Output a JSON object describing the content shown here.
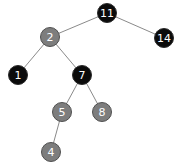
{
  "diagram": {
    "type": "red-black-tree",
    "colors": {
      "black_node": "#0b0b0b",
      "red_node_rendered_gray": "#7d7d7d",
      "edge": "#8a8a8a",
      "label": "#ffffff"
    },
    "nodes": [
      {
        "id": "n11",
        "label": "11",
        "color": "black",
        "x": 107,
        "y": 13
      },
      {
        "id": "n2",
        "label": "2",
        "color": "gray",
        "x": 50,
        "y": 37
      },
      {
        "id": "n14",
        "label": "14",
        "color": "black",
        "x": 164,
        "y": 38
      },
      {
        "id": "n1",
        "label": "1",
        "color": "black",
        "x": 18,
        "y": 75
      },
      {
        "id": "n7",
        "label": "7",
        "color": "black",
        "x": 82,
        "y": 75
      },
      {
        "id": "n5",
        "label": "5",
        "color": "gray",
        "x": 62,
        "y": 112
      },
      {
        "id": "n8",
        "label": "8",
        "color": "gray",
        "x": 102,
        "y": 112
      },
      {
        "id": "n4",
        "label": "4",
        "color": "gray",
        "x": 51,
        "y": 152
      }
    ],
    "edges": [
      {
        "from": "n11",
        "to": "n2"
      },
      {
        "from": "n11",
        "to": "n14"
      },
      {
        "from": "n2",
        "to": "n1"
      },
      {
        "from": "n2",
        "to": "n7"
      },
      {
        "from": "n7",
        "to": "n5"
      },
      {
        "from": "n7",
        "to": "n8"
      },
      {
        "from": "n5",
        "to": "n4"
      }
    ]
  }
}
